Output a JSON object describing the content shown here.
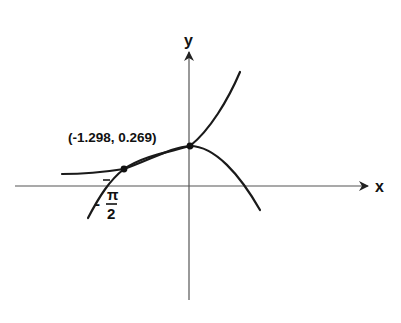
{
  "diagram": {
    "type": "function-intersection-sketch",
    "axes": {
      "x_label": "x",
      "y_label": "y"
    },
    "intersection_label": "(-1.298, 0.269)",
    "tick_label": {
      "sign": "-",
      "numerator": "π",
      "denominator": "2"
    },
    "points": [
      {
        "name": "left-intersection",
        "x": -1.298,
        "y": 0.269
      },
      {
        "name": "y-axis-intersection",
        "x": 0,
        "y": 1
      }
    ],
    "colors": {
      "curve": "#1a1a1a",
      "axis": "#555555",
      "background": "#ffffff"
    }
  }
}
